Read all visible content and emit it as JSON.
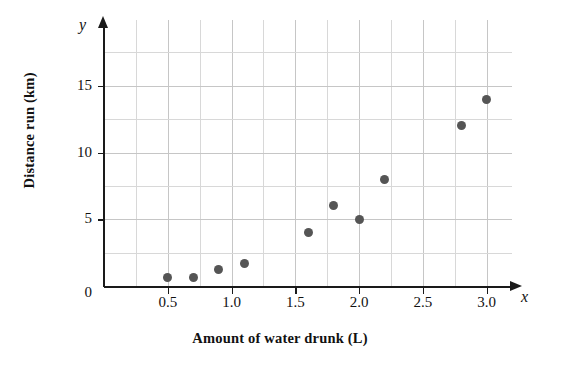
{
  "chart_data": {
    "type": "scatter",
    "title": "",
    "xlabel": "Amount of water drunk (L)",
    "ylabel": "Distance run (km)",
    "x_axis_variable": "x",
    "y_axis_variable": "y",
    "xlim": [
      0,
      3.2
    ],
    "ylim": [
      0,
      20
    ],
    "grid": true,
    "grid_color": "#d8d8d8",
    "point_color": "#555555",
    "legend": null,
    "x_ticks": [
      0.5,
      1.0,
      1.5,
      2.0,
      2.5,
      3.0
    ],
    "x_tick_labels": [
      "0.5",
      "1.0",
      "1.5",
      "2.0",
      "2.5",
      "3.0"
    ],
    "y_ticks": [
      0,
      5,
      10,
      15
    ],
    "y_tick_labels": [
      "0",
      "5",
      "10",
      "15"
    ],
    "origin_label": "0",
    "x_gridline_step": 0.25,
    "y_gridline_step": 2.5,
    "x": [
      0.5,
      0.7,
      0.9,
      1.1,
      1.6,
      1.8,
      2.0,
      2.2,
      2.8,
      3.0
    ],
    "y": [
      0.6,
      0.6,
      1.2,
      1.7,
      4.0,
      6.0,
      5.0,
      8.0,
      12.0,
      14.0
    ],
    "points": [
      {
        "x": 0.5,
        "y": 0.6
      },
      {
        "x": 0.7,
        "y": 0.6
      },
      {
        "x": 0.9,
        "y": 1.2
      },
      {
        "x": 1.1,
        "y": 1.7
      },
      {
        "x": 1.6,
        "y": 4.0
      },
      {
        "x": 1.8,
        "y": 6.0
      },
      {
        "x": 2.0,
        "y": 5.0
      },
      {
        "x": 2.2,
        "y": 8.0
      },
      {
        "x": 2.8,
        "y": 12.0
      },
      {
        "x": 3.0,
        "y": 14.0
      }
    ]
  }
}
